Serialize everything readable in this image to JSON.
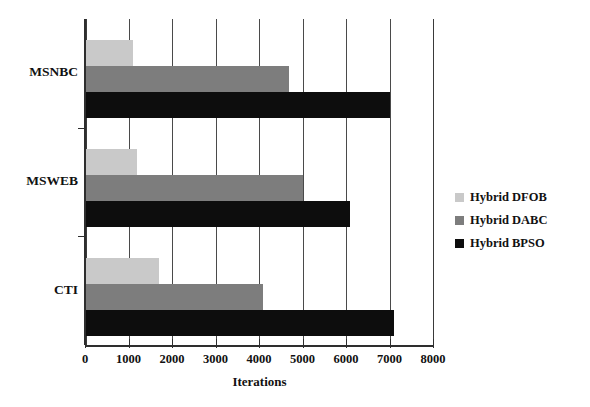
{
  "chart_data": {
    "type": "bar",
    "orientation": "horizontal",
    "title": "",
    "xlabel": "Iterations",
    "ylabel": "",
    "xlim": [
      0,
      8000
    ],
    "ylim": null,
    "grid": true,
    "legend_position": "right",
    "xticks": [
      0,
      1000,
      2000,
      3000,
      4000,
      5000,
      6000,
      7000,
      8000
    ],
    "xtick_labels": [
      "0",
      "1000",
      "2000",
      "3000",
      "4000",
      "5000",
      "6000",
      "7000",
      "8000"
    ],
    "categories": [
      "MSNBC",
      "MSWEB",
      "CTI"
    ],
    "series": [
      {
        "name": "Hybrid DFOB",
        "color": "#c9c9c9",
        "values": [
          1100,
          1200,
          1700
        ]
      },
      {
        "name": "Hybrid DABC",
        "color": "#7d7d7d",
        "values": [
          4700,
          5000,
          4100
        ]
      },
      {
        "name": "Hybrid BPSO",
        "color": "#0d0d0d",
        "values": [
          7000,
          6100,
          7100
        ]
      }
    ]
  },
  "legend": {
    "items": [
      {
        "label": "Hybrid DFOB",
        "color": "#c9c9c9"
      },
      {
        "label": "Hybrid DABC",
        "color": "#7d7d7d"
      },
      {
        "label": "Hybrid BPSO",
        "color": "#0d0d0d"
      }
    ]
  },
  "axis": {
    "x_title": "Iterations"
  }
}
